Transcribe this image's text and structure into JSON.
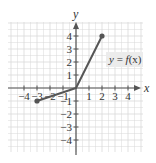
{
  "chart_data": {
    "type": "line",
    "title": "",
    "xlabel": "x",
    "ylabel": "y",
    "xlim": [
      -4,
      4
    ],
    "ylim": [
      -4,
      4
    ],
    "grid": true,
    "x_ticks": [
      -4,
      -3,
      -2,
      -1,
      1,
      2,
      3,
      4
    ],
    "y_ticks": [
      4,
      3,
      2,
      1,
      -1,
      -2,
      -3,
      -4
    ],
    "x_tick_labels": [
      "-4",
      "-3",
      "-2",
      "-1",
      "1",
      "2",
      "3",
      "4"
    ],
    "y_tick_labels": [
      "4",
      "3",
      "2",
      "1",
      "-1",
      "-2",
      "-3",
      "-4"
    ],
    "series": [
      {
        "name": "y = f(x)",
        "points": [
          [
            -3,
            -1
          ],
          [
            0,
            0
          ],
          [
            2,
            4
          ]
        ],
        "endpoints_closed": true,
        "color": "#555555"
      }
    ],
    "annotations": [
      {
        "text": "y = f(x)",
        "at": [
          3.4,
          2
        ]
      }
    ]
  },
  "labels": {
    "x_axis": "x",
    "y_axis": "y",
    "fn_y": "y",
    "fn_eq": " = ",
    "fn_f": "f",
    "fn_arg": "(x)"
  },
  "colors": {
    "grid": "#d9d9d9",
    "axis": "#555555",
    "line": "#555555",
    "label_bg": "#ececec"
  }
}
